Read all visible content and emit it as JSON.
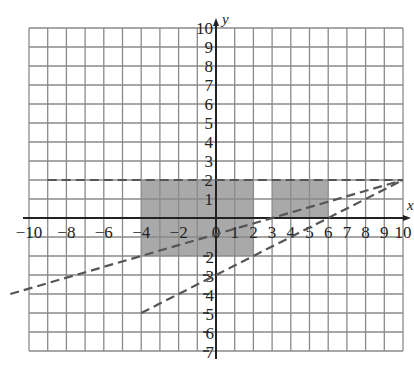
{
  "diagram": {
    "axes": {
      "x_label": "x",
      "y_label": "y",
      "x_range": [
        -10,
        10
      ],
      "y_range": [
        -7,
        10
      ],
      "x_ticks": [
        "−10",
        "−8",
        "−6",
        "−4",
        "−2",
        "0",
        "1",
        "2",
        "3",
        "4",
        "5",
        "6",
        "7",
        "8",
        "9",
        "10"
      ],
      "y_ticks_pos": [
        "10",
        "9",
        "8",
        "7",
        "6",
        "5",
        "4",
        "3",
        "2",
        "1"
      ],
      "y_ticks_neg": [
        "2",
        "3",
        "4",
        "5",
        "6",
        "7"
      ]
    },
    "shaded_regions": [
      {
        "x": [
          -4,
          2
        ],
        "y": [
          0,
          2
        ],
        "color": "#9a9a9a"
      },
      {
        "x": [
          -4,
          2
        ],
        "y": [
          -2,
          0
        ],
        "color": "#9a9a9a"
      },
      {
        "x": [
          3,
          6
        ],
        "y": [
          0,
          2
        ],
        "color": "#9a9a9a"
      }
    ],
    "dashed_lines": [
      {
        "name": "y = 2",
        "from": [
          -9,
          2
        ],
        "to": [
          10,
          2
        ]
      },
      {
        "name": "y = 2x/7 - 6/7",
        "from": [
          -11,
          -4
        ],
        "to": [
          10,
          2
        ]
      },
      {
        "name": "y = x/2 - 3",
        "from": [
          -4,
          -5
        ],
        "to": [
          10,
          2
        ]
      }
    ]
  }
}
